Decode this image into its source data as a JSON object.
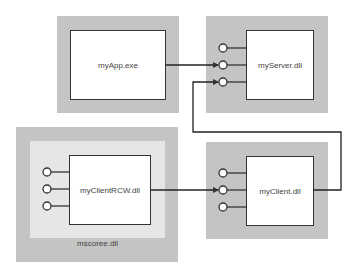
{
  "diagram": {
    "nodes": {
      "myapp": {
        "label": "myApp.exe"
      },
      "myserver": {
        "label": "myServer.dll"
      },
      "mscoree": {
        "label": "mscoree.dll"
      },
      "myclientrcw": {
        "label": "myClientRCW.dll"
      },
      "myclient": {
        "label": "myClient.dll"
      }
    },
    "edges": [
      {
        "from": "myApp.exe",
        "to": "myServer.dll",
        "port": 2
      },
      {
        "from": "myClientRCW.dll",
        "to": "myClient.dll",
        "port": 2
      },
      {
        "from": "myClient.dll",
        "to": "myServer.dll",
        "port": 3
      }
    ],
    "colors": {
      "outer_fill": "#c4c4c4",
      "host_fill": "#e6e6e6",
      "box_fill": "#ffffff",
      "stroke": "#333333"
    }
  }
}
